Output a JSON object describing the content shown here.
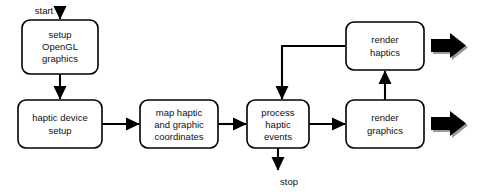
{
  "diagram": {
    "background_color": "#ffffff",
    "stroke_color": "#000000",
    "text_color": "#111111",
    "block_arrow_color": "#000000",
    "block_arrow_shadow_color": "#9a9a9a",
    "nodes": [
      {
        "id": "setup-opengl-graphics",
        "lines": [
          "setup",
          "OpenGL",
          "graphics"
        ],
        "x": 22,
        "y": 20,
        "w": 76,
        "h": 54
      },
      {
        "id": "haptic-device-setup",
        "lines": [
          "haptic device",
          "setup"
        ],
        "x": 18,
        "y": 100,
        "w": 84,
        "h": 48
      },
      {
        "id": "map-haptic-and-graphic-coordinates",
        "lines": [
          "map haptic",
          "and graphic",
          "coordinates"
        ],
        "x": 140,
        "y": 100,
        "w": 78,
        "h": 48
      },
      {
        "id": "process-haptic-events",
        "lines": [
          "process",
          "haptic",
          "events"
        ],
        "x": 247,
        "y": 100,
        "w": 62,
        "h": 48
      },
      {
        "id": "render-graphics",
        "lines": [
          "render",
          "graphics"
        ],
        "x": 346,
        "y": 100,
        "w": 78,
        "h": 48
      },
      {
        "id": "render-haptics",
        "lines": [
          "render",
          "haptics"
        ],
        "x": 346,
        "y": 22,
        "w": 78,
        "h": 48
      }
    ],
    "edge_labels": [
      {
        "id": "start",
        "text": "start",
        "x": 44,
        "y": 11
      },
      {
        "id": "stop",
        "text": "stop",
        "x": 289,
        "y": 182
      }
    ]
  }
}
